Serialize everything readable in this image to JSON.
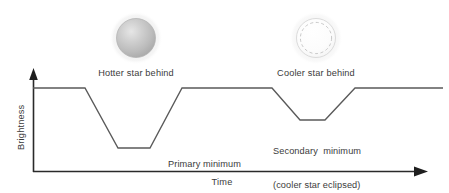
{
  "figure": {
    "line_color": "#5a5a5a",
    "axis_color": "#2a2a2a",
    "text_color": "#3b3b3b"
  },
  "axes": {
    "y_label": "Brightness",
    "x_label": "Time"
  },
  "stars": [
    {
      "name": "hotter-star",
      "caption": "Hotter star behind",
      "fill": "#b9b9b9",
      "style": "solid-sphere"
    },
    {
      "name": "cooler-star",
      "caption": "Cooler star behind",
      "fill": "#fbfbfb",
      "style": "dashed-outline-sphere"
    }
  ],
  "annotations": [
    {
      "name": "primary-minimum",
      "line1": "Primary minimum",
      "line2": "(hotter star eclipsed)"
    },
    {
      "name": "secondary-minimum",
      "line1": "Secondary  minimum",
      "line2": "(cooler star eclipsed)"
    }
  ],
  "chart_data": {
    "type": "line",
    "xlabel": "Time",
    "ylabel": "Brightness",
    "grid": false,
    "legend": null,
    "axis_ranges": {
      "x": [
        0,
        100
      ],
      "y": [
        0,
        100
      ]
    },
    "series": [
      {
        "name": "Brightness",
        "comment": "Normalized light curve: 100 = out-of-eclipse plateau, deeper primary minimum, shallower secondary minimum",
        "x": [
          0,
          13,
          22,
          30,
          39,
          46,
          62,
          85,
          93,
          100
        ],
        "y": [
          100,
          100,
          30,
          30,
          100,
          100,
          100,
          65,
          65,
          100
        ]
      }
    ],
    "points_px": [
      [
        33,
        88
      ],
      [
        85,
        88
      ],
      [
        118,
        148
      ],
      [
        150,
        148
      ],
      [
        182,
        88
      ],
      [
        272,
        88
      ],
      [
        300,
        120
      ],
      [
        325,
        120
      ],
      [
        355,
        88
      ],
      [
        443,
        88
      ]
    ],
    "plateau_level": 100,
    "primary_minimum_level": 30,
    "secondary_minimum_level": 65
  }
}
